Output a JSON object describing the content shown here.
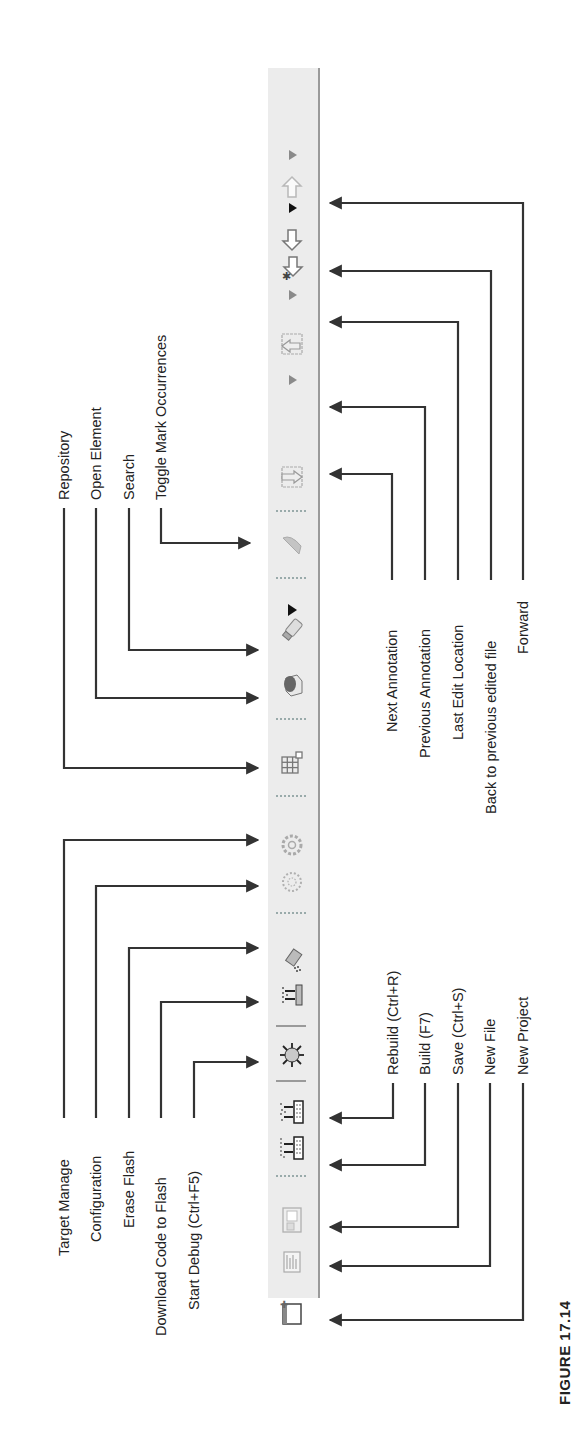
{
  "figure": {
    "caption": "FIGURE 17.14"
  },
  "toolbar": {
    "orientation": "rotated 90° counter-clockwise",
    "background_color": "#ececec",
    "items": [
      {
        "id": "dropdown-forward",
        "icon": "dropdown-arrow-icon"
      },
      {
        "id": "forward",
        "icon": "arrow-up-icon",
        "label": "Forward"
      },
      {
        "id": "dropdown-back",
        "icon": "dropdown-arrow-icon"
      },
      {
        "id": "back-edited",
        "icon": "arrow-down-icon",
        "label": "Back to previous edited file"
      },
      {
        "id": "last-edit",
        "icon": "arrow-down-star-icon",
        "label": "Last Edit Location"
      },
      {
        "id": "dropdown-prev-annotation",
        "icon": "dropdown-arrow-icon"
      },
      {
        "id": "previous-annotation",
        "icon": "previous-annotation-icon",
        "label": "Previous Annotation"
      },
      {
        "id": "dropdown-next-annotation",
        "icon": "dropdown-arrow-icon"
      },
      {
        "id": "next-annotation",
        "icon": "next-annotation-icon",
        "label": "Next Annotation"
      },
      {
        "id": "toggle-mark",
        "icon": "highlighter-icon",
        "label": "Toggle Mark Occurrences"
      },
      {
        "id": "dropdown-search",
        "icon": "dropdown-arrow-icon"
      },
      {
        "id": "search",
        "icon": "flashlight-icon",
        "label": "Search"
      },
      {
        "id": "open-element",
        "icon": "open-element-icon",
        "label": "Open Element"
      },
      {
        "id": "repository",
        "icon": "grid-icon",
        "label": "Repository"
      },
      {
        "id": "configuration",
        "icon": "gear-icon",
        "label": "Configuration"
      },
      {
        "id": "target-manage",
        "icon": "gear-dotted-icon",
        "label": "Target Manage"
      },
      {
        "id": "erase-flash",
        "icon": "erase-flash-icon",
        "label": "Erase Flash"
      },
      {
        "id": "download-flash",
        "icon": "download-chip-icon",
        "label": "Download Code to Flash"
      },
      {
        "id": "start-debug",
        "icon": "bug-icon",
        "label": "Start Debug (Ctrl+F5)"
      },
      {
        "id": "rebuild",
        "icon": "rebuild-icon",
        "label": "Rebuild (Ctrl+R)"
      },
      {
        "id": "build",
        "icon": "build-icon",
        "label": "Build (F7)"
      },
      {
        "id": "save",
        "icon": "save-icon",
        "label": "Save (Ctrl+S)"
      },
      {
        "id": "new-file",
        "icon": "new-file-icon",
        "label": "New File"
      },
      {
        "id": "new-project",
        "icon": "new-project-icon",
        "label": "New Project"
      }
    ]
  },
  "callouts_left": {
    "repository": "Repository",
    "open_element": "Open Element",
    "search": "Search",
    "toggle_mark": "Toggle Mark Occurrences",
    "target_manage": "Target Manage",
    "configuration": "Configuration",
    "erase_flash": "Erase Flash",
    "download_flash": "Download Code to Flash",
    "start_debug": "Start Debug (Ctrl+F5)"
  },
  "callouts_right": {
    "next_annotation": "Next Annotation",
    "previous_annotation": "Previous Annotation",
    "last_edit": "Last Edit Location",
    "back_edited": "Back to previous edited file",
    "forward": "Forward",
    "rebuild": "Rebuild (Ctrl+R)",
    "build": "Build (F7)",
    "save": "Save (Ctrl+S)",
    "new_file": "New File",
    "new_project": "New Project"
  }
}
